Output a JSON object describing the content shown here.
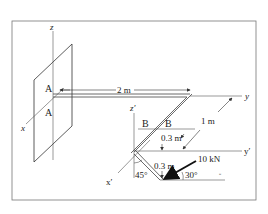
{
  "figure": {
    "axes": {
      "z": "z",
      "x": "x",
      "y": "y",
      "z_prime": "z′",
      "x_prime": "x′",
      "y_prime": "y′"
    },
    "points": {
      "A_top": "A",
      "A_bottom": "A",
      "B_left": "B",
      "B_right": "B"
    },
    "dimensions": {
      "length_AB": "2 m",
      "offset_1": "1 m",
      "offset_upper": "0.3 m",
      "offset_lower": "0.3 m"
    },
    "angles": {
      "pipe_angle": "45°",
      "force_angle": "30°"
    },
    "force": {
      "label": "10 kN"
    },
    "marker": "▫"
  }
}
